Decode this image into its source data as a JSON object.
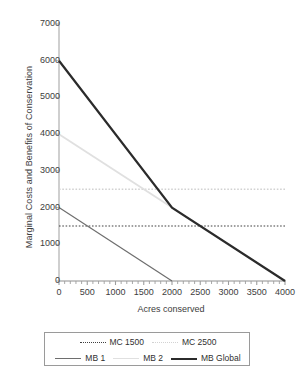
{
  "chart_data": {
    "type": "line",
    "title": "",
    "xlabel": "Acres conserved",
    "ylabel": "Marginal Costs and Benefits of Conservation",
    "xlim": [
      0,
      4000
    ],
    "ylim": [
      0,
      7000
    ],
    "xticks": [
      "0",
      "500",
      "1000",
      "1500",
      "2000",
      "2500",
      "3000",
      "3500",
      "4000"
    ],
    "yticks": [
      "0",
      "1000",
      "2000",
      "3000",
      "4000",
      "5000",
      "6000",
      "7000"
    ],
    "xtick_values": [
      0,
      500,
      1000,
      1500,
      2000,
      2500,
      3000,
      3500,
      4000
    ],
    "ytick_values": [
      0,
      1000,
      2000,
      3000,
      4000,
      5000,
      6000,
      7000
    ],
    "grid": false,
    "minor_ticks_x": true,
    "legend_position": "bottom",
    "series": [
      {
        "name": "MC 1500",
        "style": "dotted",
        "color": "#404040",
        "width": 1.1,
        "points": [
          [
            0,
            1500
          ],
          [
            4000,
            1500
          ]
        ]
      },
      {
        "name": "MC 2500",
        "style": "dotted",
        "color": "#d2d2d2",
        "width": 1.4,
        "points": [
          [
            0,
            2500
          ],
          [
            4000,
            2500
          ]
        ]
      },
      {
        "name": "MB 1",
        "style": "solid",
        "color": "#6e6e6e",
        "width": 1.2,
        "points": [
          [
            0,
            2000
          ],
          [
            2000,
            0
          ]
        ]
      },
      {
        "name": "MB 2",
        "style": "solid",
        "color": "#e0e0e0",
        "width": 1.8,
        "points": [
          [
            0,
            4000
          ],
          [
            2000,
            2000
          ]
        ]
      },
      {
        "name": "MB Global",
        "style": "solid",
        "color": "#2b2b2b",
        "width": 2.2,
        "points": [
          [
            0,
            6000
          ],
          [
            2000,
            2000
          ],
          [
            4000,
            0
          ]
        ]
      }
    ]
  },
  "legend": {
    "row1": [
      {
        "label": "MC 1500",
        "swatch": "dotted-dark-line-icon"
      },
      {
        "label": "MC 2500",
        "swatch": "dotted-light-line-icon"
      }
    ],
    "row2": [
      {
        "label": "MB 1",
        "swatch": "solid-gray-line-icon"
      },
      {
        "label": "MB 2",
        "swatch": "solid-medium-line-icon"
      },
      {
        "label": "MB Global",
        "swatch": "solid-black-line-icon"
      }
    ]
  }
}
